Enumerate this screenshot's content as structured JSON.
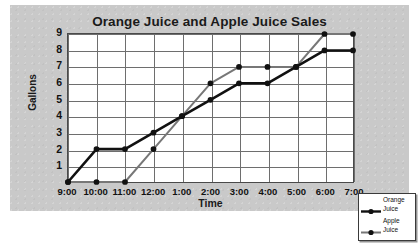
{
  "chart_data": {
    "type": "line",
    "title": "Orange Juice and Apple Juice Sales",
    "xlabel": "Time",
    "ylabel": "Gallons",
    "categories": [
      "9:00",
      "10:00",
      "11:00",
      "12:00",
      "1:00",
      "2:00",
      "3:00",
      "4:00",
      "5:00",
      "6:00",
      "7:00"
    ],
    "yticks": [
      "9",
      "8",
      "7",
      "6",
      "5",
      "4",
      "3",
      "2",
      "1"
    ],
    "ylim": [
      0,
      9
    ],
    "grid": "both",
    "legend_position": "bottom-right",
    "series": [
      {
        "name": "Orange Juice",
        "color": "#111111",
        "values": [
          0,
          2,
          2,
          3,
          4,
          5,
          6,
          6,
          7,
          8,
          8
        ]
      },
      {
        "name": "Apple Juice",
        "color": "#777777",
        "values": [
          0,
          0,
          0,
          2,
          4,
          6,
          7,
          7,
          7,
          9,
          9
        ]
      }
    ]
  },
  "legend": {
    "entries": [
      {
        "line1": "Orange",
        "line2": "Juice"
      },
      {
        "line1": "Apple",
        "line2": "Juice"
      }
    ]
  },
  "colors": {
    "canvas": "#c9c9c9",
    "plot_background": "#ffffff",
    "grid": "#6e6e6e",
    "axis": "#4a4a4a",
    "orange_juice_series": "#111111",
    "apple_juice_series": "#777777"
  }
}
